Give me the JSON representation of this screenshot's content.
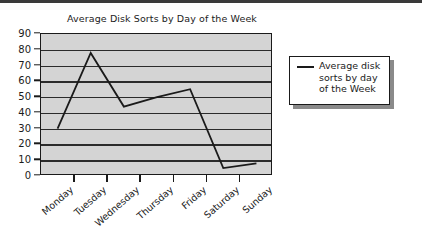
{
  "chart_data": {
    "type": "line",
    "title": "Average Disk Sorts by Day of the Week",
    "xlabel": "",
    "ylabel": "",
    "categories": [
      "Monday",
      "Tuesday",
      "Wednesday",
      "Thursday",
      "Friday",
      "Saturday",
      "Sunday"
    ],
    "series": [
      {
        "name": "Average disk sorts by day of the Week",
        "values": [
          30,
          78,
          44,
          50,
          55,
          5,
          8
        ]
      }
    ],
    "ylim": [
      0,
      90
    ],
    "ytick_step": 10,
    "yticks": [
      90,
      80,
      70,
      60,
      50,
      40,
      30,
      20,
      10,
      0
    ],
    "grid": "horizontal",
    "legend_position": "right",
    "legend_entries": [
      {
        "label": "Average disk sorts by day of the Week",
        "label_lines": [
          "Average disk",
          "sorts by day",
          "of the Week"
        ],
        "marker": "line",
        "color": "#1a1a1a"
      }
    ],
    "colors": {
      "series_line": "#1a1a1a",
      "plot_background": "#d4d4d4",
      "gridline": "#2b2b2b",
      "axis": "#1a1a1a",
      "text": "#1b1b1b",
      "page_background": "#ffffff",
      "legend_background": "#ffffff",
      "legend_shadow": "#8a8a8a"
    }
  }
}
